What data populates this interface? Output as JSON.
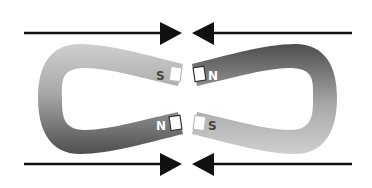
{
  "diagram": {
    "left_magnet": {
      "top_pole": "S",
      "bottom_pole": "N",
      "colors": {
        "light": "#c8c8c8",
        "dark": "#5a5a5a"
      }
    },
    "right_magnet": {
      "top_pole": "N",
      "bottom_pole": "S",
      "colors": {
        "light": "#c8c8c8",
        "dark": "#5a5a5a"
      }
    },
    "arrows": [
      {
        "position": "top-left",
        "direction": "right"
      },
      {
        "position": "top-right",
        "direction": "left"
      },
      {
        "position": "bottom-left",
        "direction": "right"
      },
      {
        "position": "bottom-right",
        "direction": "left"
      }
    ],
    "arrow_color": "#111111"
  }
}
